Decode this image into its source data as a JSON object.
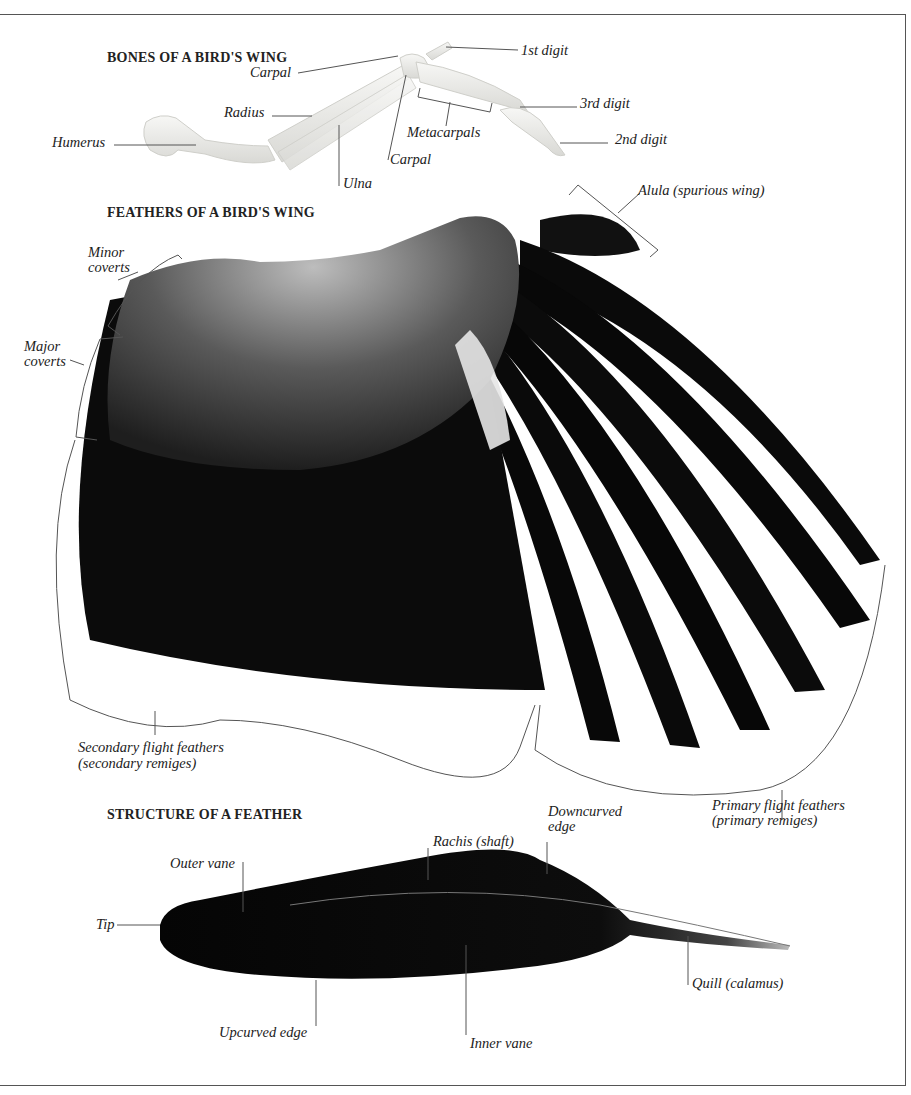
{
  "sections": {
    "bones": {
      "heading": "BONES OF A BIRD'S WING",
      "labels": {
        "carpal_upper": "Carpal",
        "radius": "Radius",
        "humerus": "Humerus",
        "ulna": "Ulna",
        "carpal_lower": "Carpal",
        "metacarpals": "Metacarpals",
        "first_digit": "1st digit",
        "third_digit": "3rd digit",
        "second_digit": "2nd digit"
      }
    },
    "feathers": {
      "heading": "FEATHERS OF A BIRD'S WING",
      "labels": {
        "alula": "Alula (spurious wing)",
        "minor_coverts_1": "Minor",
        "minor_coverts_2": "coverts",
        "major_coverts_1": "Major",
        "major_coverts_2": "coverts",
        "secondary_1": "Secondary flight feathers",
        "secondary_2": "(secondary remiges)",
        "primary_1": "Primary flight feathers",
        "primary_2": "(primary remiges)"
      }
    },
    "structure": {
      "heading": "STRUCTURE OF A FEATHER",
      "labels": {
        "downcurved_1": "Downcurved",
        "downcurved_2": "edge",
        "rachis": "Rachis (shaft)",
        "outer_vane": "Outer vane",
        "tip": "Tip",
        "quill": "Quill (calamus)",
        "upcurved": "Upcurved edge",
        "inner_vane": "Inner vane"
      }
    }
  },
  "colors": {
    "ink": "#222222",
    "leader": "#555555",
    "bone": "#e9e9e6",
    "feather_dark": "#0a0a0a",
    "covert_gray": "#5a5a5a"
  }
}
